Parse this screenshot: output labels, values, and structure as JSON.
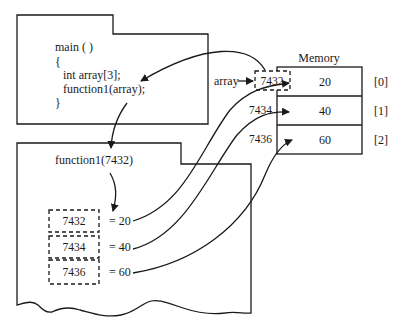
{
  "main_frame": {
    "code_lines": [
      "main ( )",
      "{",
      "int array[3];",
      "function1(array);",
      "}"
    ]
  },
  "function_frame": {
    "call_label": "function1(7432)",
    "params": [
      {
        "address": "7432",
        "value_text": "= 20"
      },
      {
        "address": "7434",
        "value_text": "= 40"
      },
      {
        "address": "7436",
        "value_text": "= 60"
      }
    ]
  },
  "memory": {
    "title": "Memory",
    "pointer_label": "array",
    "pointer_value": "7432",
    "cells": [
      {
        "address": "7432",
        "value": "20",
        "index": "[0]"
      },
      {
        "address": "7434",
        "value": "40",
        "index": "[1]"
      },
      {
        "address": "7436",
        "value": "60",
        "index": "[2]"
      }
    ]
  },
  "colors": {
    "line": "#1a1a1a",
    "background": "#ffffff"
  }
}
